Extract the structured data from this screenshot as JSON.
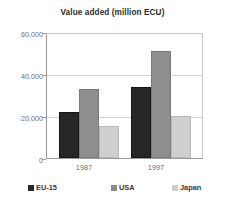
{
  "chart_data": {
    "type": "bar",
    "title": "Value added (million ECU)",
    "xlabel": "",
    "ylabel": "",
    "categories": [
      "1987",
      "1997"
    ],
    "series": [
      {
        "name": "EU-15",
        "color": "#262626",
        "values": [
          21800,
          33600
        ]
      },
      {
        "name": "USA",
        "color": "#8e8e8e",
        "values": [
          32700,
          51000
        ]
      },
      {
        "name": "Japan",
        "color": "#cfcfcf",
        "values": [
          15200,
          19800
        ]
      }
    ],
    "ylim": [
      0,
      60000
    ],
    "yticks": [
      0,
      20000,
      40000,
      60000
    ],
    "ytick_labels": [
      "0",
      "20,000",
      "40,000",
      "60,000"
    ],
    "grid": true,
    "legend_position": "bottom"
  }
}
